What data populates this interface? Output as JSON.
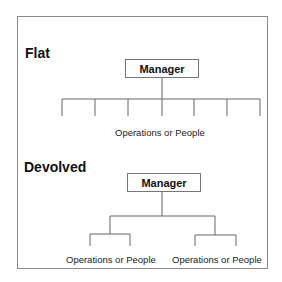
{
  "diagram": {
    "sections": [
      {
        "title": "Flat",
        "root": "Manager",
        "children_count": 7,
        "children_label": "Operations or People"
      },
      {
        "title": "Devolved",
        "root": "Manager",
        "branches": [
          {
            "label": "Operations or People",
            "children_count": 2
          },
          {
            "label": "Operations or People",
            "children_count": 2
          }
        ]
      }
    ]
  }
}
